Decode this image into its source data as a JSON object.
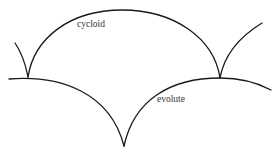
{
  "diagram": {
    "labels": {
      "cycloid": "cycloid",
      "evolute": "evolute"
    },
    "stroke_color": "#1a1a1a",
    "paths": {
      "cycloid_left_tail": "M15,43 Q24,56 28,77",
      "cycloid_main_arch": "M28,77 C34,38 70,10 122,10 C174,10 214,38 220,78",
      "cycloid_right_tail": "M220,78 Q226,45 262,23",
      "evolute_left": "M9,79 C60,75 110,92 124,146",
      "evolute_right": "M124,146 C134,100 170,78 220,78 C240,78 258,83 271,90"
    }
  }
}
